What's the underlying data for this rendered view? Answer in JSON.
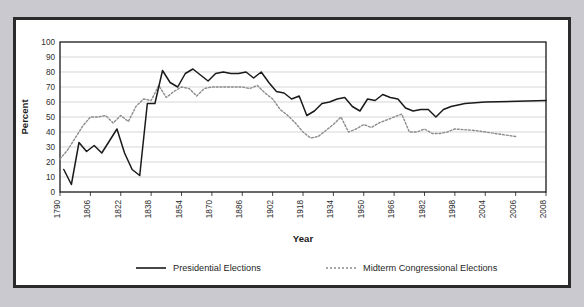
{
  "chart_data": {
    "type": "line",
    "title": "",
    "xlabel": "Year",
    "ylabel": "Percent",
    "ylim": [
      0,
      100
    ],
    "xlim": [
      1790,
      2008
    ],
    "ytick_labels": [
      "0",
      "10",
      "20",
      "30",
      "40",
      "50",
      "60",
      "70",
      "80",
      "90",
      "100"
    ],
    "yticks": [
      0,
      10,
      20,
      30,
      40,
      50,
      60,
      70,
      80,
      90,
      100
    ],
    "xtick_labels": [
      "1790",
      "1806",
      "1822",
      "1838",
      "1854",
      "1870",
      "1886",
      "1902",
      "1918",
      "1934",
      "1950",
      "1966",
      "1982",
      "1998",
      "2004",
      "2006",
      "2008"
    ],
    "xticks": [
      1790,
      1806,
      1822,
      1838,
      1854,
      1870,
      1886,
      1902,
      1918,
      1934,
      1950,
      1966,
      1982,
      1998,
      2004,
      2006,
      2008
    ],
    "grid": "horizontal",
    "legend_position": "bottom",
    "series": [
      {
        "name": "Presidential Elections",
        "style": "solid",
        "color": "#1a1a1a",
        "x": [
          1792,
          1796,
          1800,
          1804,
          1808,
          1812,
          1816,
          1820,
          1824,
          1828,
          1832,
          1836,
          1840,
          1844,
          1848,
          1852,
          1856,
          1860,
          1864,
          1868,
          1872,
          1876,
          1880,
          1884,
          1888,
          1892,
          1896,
          1900,
          1904,
          1908,
          1912,
          1916,
          1920,
          1924,
          1928,
          1932,
          1936,
          1940,
          1944,
          1948,
          1952,
          1956,
          1960,
          1964,
          1968,
          1972,
          1976,
          1980,
          1984,
          1988,
          1992,
          1996,
          2000,
          2004,
          2008
        ],
        "values": [
          15,
          5,
          33,
          27,
          31,
          26,
          34,
          42,
          26,
          15,
          11,
          59,
          59,
          81,
          73,
          70,
          79,
          82,
          78,
          74,
          79,
          80,
          79,
          79,
          80,
          76,
          80,
          73,
          67,
          66,
          62,
          64,
          51,
          54,
          59,
          60,
          62,
          63,
          57,
          54,
          62,
          61,
          65,
          63,
          62,
          56,
          54,
          55,
          55,
          50,
          55,
          57,
          59,
          60,
          61
        ]
      },
      {
        "name": "Midterm Congressional Elections",
        "style": "dotted",
        "color": "#8c8c8c",
        "x": [
          1790,
          1794,
          1798,
          1802,
          1806,
          1810,
          1814,
          1818,
          1822,
          1826,
          1830,
          1834,
          1838,
          1842,
          1846,
          1850,
          1854,
          1858,
          1862,
          1866,
          1870,
          1874,
          1878,
          1882,
          1886,
          1890,
          1894,
          1898,
          1902,
          1906,
          1910,
          1914,
          1918,
          1922,
          1926,
          1930,
          1934,
          1938,
          1942,
          1946,
          1950,
          1954,
          1958,
          1962,
          1966,
          1970,
          1974,
          1978,
          1982,
          1986,
          1990,
          1994,
          1998,
          2002,
          2006
        ],
        "values": [
          22,
          28,
          36,
          44,
          50,
          50,
          51,
          46,
          51,
          47,
          57,
          62,
          61,
          71,
          63,
          67,
          70,
          69,
          64,
          69,
          70,
          70,
          70,
          70,
          70,
          69,
          71,
          66,
          62,
          55,
          51,
          46,
          40,
          36,
          37,
          41,
          45,
          50,
          40,
          42,
          45,
          43,
          46,
          48,
          50,
          52,
          40,
          40,
          42,
          39,
          39,
          40,
          42,
          41,
          37
        ]
      }
    ],
    "legend": [
      {
        "label": "Presidential Elections",
        "style": "solid",
        "color": "#1a1a1a"
      },
      {
        "label": "Midterm Congressional Elections",
        "style": "dotted",
        "color": "#8c8c8c"
      }
    ]
  },
  "colors": {
    "page_background": "#c9c9cf",
    "card_background": "#ffffff",
    "card_border": "#2b2b2b",
    "gridline": "#c4c4c4",
    "axis": "#1a1a1a"
  }
}
